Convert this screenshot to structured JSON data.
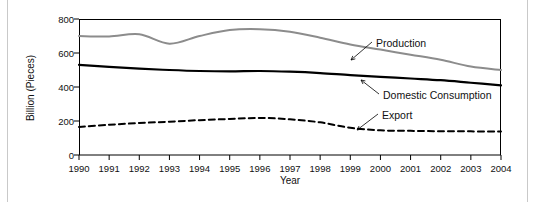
{
  "chart_data": {
    "type": "line",
    "title": "",
    "xlabel": "Year",
    "ylabel": "Billion (Pieces)",
    "xlim": [
      1990,
      2004
    ],
    "ylim": [
      0,
      800
    ],
    "ytick_labels": [
      "0",
      "200",
      "400",
      "600",
      "800"
    ],
    "yticks": [
      0,
      200,
      400,
      600,
      800
    ],
    "xtick_labels": [
      "1990",
      "1991",
      "1992",
      "1993",
      "1994",
      "1995",
      "1996",
      "1997",
      "1998",
      "1999",
      "2000",
      "2001",
      "2002",
      "2003",
      "2004"
    ],
    "x": [
      1990,
      1991,
      1992,
      1993,
      1994,
      1995,
      1996,
      1997,
      1998,
      1999,
      2000,
      2001,
      2002,
      2003,
      2004
    ],
    "grid": false,
    "legend_position": "inline-annotations",
    "series": [
      {
        "name": "Production",
        "color": "#8c8c8c",
        "style": "solid",
        "width": 2,
        "values": [
          700,
          697,
          710,
          655,
          700,
          735,
          740,
          725,
          690,
          650,
          620,
          590,
          560,
          520,
          500
        ]
      },
      {
        "name": "Domestic Consumption",
        "color": "#000000",
        "style": "solid",
        "width": 2.2,
        "values": [
          530,
          518,
          508,
          500,
          494,
          492,
          494,
          490,
          482,
          470,
          460,
          450,
          440,
          425,
          410
        ]
      },
      {
        "name": "Export",
        "color": "#000000",
        "style": "dashed",
        "width": 2,
        "values": [
          165,
          178,
          188,
          196,
          205,
          212,
          218,
          210,
          192,
          160,
          145,
          142,
          140,
          139,
          138
        ]
      }
    ],
    "annotations": [
      {
        "label": "Production",
        "text_x": 376,
        "text_y": 47,
        "leader_from_x": 372,
        "leader_from_y": 42,
        "leader_to_x": 351,
        "leader_to_y": 60
      },
      {
        "label": "Domestic Consumption",
        "text_x": 383,
        "text_y": 99,
        "leader_from_x": 379,
        "leader_from_y": 94,
        "leader_to_x": 361,
        "leader_to_y": 80
      },
      {
        "label": "Export",
        "text_x": 382,
        "text_y": 119,
        "leader_from_x": 378,
        "leader_from_y": 114,
        "leader_to_x": 357,
        "leader_to_y": 130
      }
    ]
  }
}
